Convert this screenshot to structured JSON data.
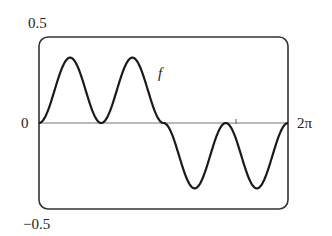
{
  "chart_data": {
    "type": "line",
    "title": "",
    "xlabel": "",
    "ylabel": "",
    "xlim": [
      0,
      6.2832
    ],
    "ylim": [
      -0.5,
      0.5
    ],
    "grid": false,
    "legend": "none",
    "tick_labels": {
      "y_top": "0.5",
      "y_zero": "0",
      "y_bottom": "−0.5",
      "x_right": "2π"
    },
    "annotations": [
      {
        "text": "f",
        "x": 2.75,
        "y": 0.28
      }
    ],
    "series": [
      {
        "name": "f",
        "x": [
          0,
          0.3927,
          0.7854,
          1.1781,
          1.5708,
          1.9635,
          2.3562,
          2.7489,
          3.1416,
          3.5343,
          3.927,
          4.3197,
          4.7124,
          5.1051,
          5.4978,
          5.8905,
          6.2832
        ],
        "values": [
          0,
          0.23,
          0.38,
          0.23,
          0,
          0.23,
          0.38,
          0.23,
          0,
          -0.23,
          -0.38,
          -0.23,
          0,
          -0.23,
          -0.38,
          -0.23,
          0
        ]
      }
    ]
  },
  "labels": {
    "y_top": "0.5",
    "y_zero": "0",
    "y_bottom": "−0.5",
    "x_right": "2π",
    "curve_name": "f"
  },
  "colors": {
    "curve": "#1a1a1a",
    "frame": "#333333",
    "axis": "#666666"
  }
}
